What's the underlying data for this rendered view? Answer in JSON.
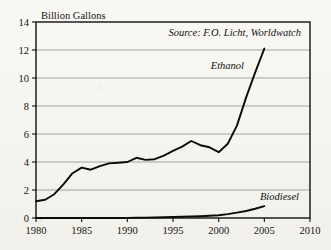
{
  "chart_data": {
    "type": "line",
    "title": "",
    "xlabel": "",
    "ylabel": "Billion Gallons",
    "yunit_label": "Billion Gallons",
    "xlim": [
      1980,
      2010
    ],
    "ylim": [
      0,
      14
    ],
    "yticks": [
      0,
      2,
      4,
      6,
      8,
      10,
      12,
      14
    ],
    "ytick_labels": [
      "0",
      "2",
      "4",
      "6",
      "8",
      "10",
      "12",
      "14"
    ],
    "xticks": [
      1980,
      1985,
      1990,
      1995,
      2000,
      2005,
      2010
    ],
    "xtick_labels": [
      "1980",
      "1985",
      "1990",
      "1995",
      "2000",
      "2005",
      "2010"
    ],
    "grid": true,
    "grid_axis": "y",
    "legend_position": "inline-annotation",
    "source_note": "Source: F.O. Licht, Worldwatch",
    "line_color": "#0b0b0b",
    "background_color": "#f8f6f1",
    "x": [
      1980,
      1981,
      1982,
      1983,
      1984,
      1985,
      1986,
      1987,
      1988,
      1989,
      1990,
      1991,
      1992,
      1993,
      1994,
      1995,
      1996,
      1997,
      1998,
      1999,
      2000,
      2001,
      2002,
      2003,
      2004,
      2005
    ],
    "series": [
      {
        "name": "Ethanol",
        "label": "Ethanol",
        "values": [
          1.2,
          1.3,
          1.7,
          2.4,
          3.2,
          3.6,
          3.45,
          3.7,
          3.9,
          3.95,
          4.0,
          4.3,
          4.15,
          4.2,
          4.45,
          4.8,
          5.1,
          5.5,
          5.2,
          5.05,
          4.7,
          5.3,
          6.6,
          8.6,
          10.4,
          12.1
        ]
      },
      {
        "name": "Biodiesel",
        "label": "Biodiesel",
        "values": [
          0.0,
          0.0,
          0.0,
          0.0,
          0.0,
          0.0,
          0.0,
          0.0,
          0.0,
          0.0,
          0.01,
          0.02,
          0.03,
          0.04,
          0.05,
          0.07,
          0.09,
          0.11,
          0.13,
          0.16,
          0.2,
          0.28,
          0.38,
          0.5,
          0.66,
          0.85
        ]
      }
    ]
  },
  "annotations": {
    "source": "Source: F.O. Licht, Worldwatch",
    "ethanol_label": "Ethanol",
    "biodiesel_label": "Biodiesel",
    "y_unit": "Billion Gallons"
  }
}
